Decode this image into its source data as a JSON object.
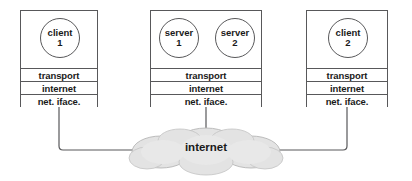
{
  "diagram": {
    "canvas": {
      "width": 412,
      "height": 181,
      "background": "#ffffff"
    },
    "colors": {
      "stroke": "#58585a",
      "text": "#1a1a1a",
      "cloud_fill": "#e3e3e3",
      "cloud_stroke": "#9a9a9a",
      "box_fill": "#ffffff"
    },
    "hosts": [
      {
        "id": "client-1-host",
        "x": 20,
        "y": 10,
        "width": 78,
        "height": 97,
        "apps": [
          {
            "id": "client-1",
            "line1": "client",
            "line2": "1",
            "cx": 59,
            "cy": 37,
            "r": 20
          }
        ],
        "layers": [
          {
            "id": "transport",
            "label": "transport"
          },
          {
            "id": "internet",
            "label": "internet"
          },
          {
            "id": "net-iface",
            "label": "net. iface."
          }
        ]
      },
      {
        "id": "server-host",
        "x": 150,
        "y": 10,
        "width": 112,
        "height": 97,
        "apps": [
          {
            "id": "server-1",
            "line1": "server",
            "line2": "1",
            "cx": 178,
            "cy": 37,
            "r": 20
          },
          {
            "id": "server-2",
            "line1": "server",
            "line2": "2",
            "cx": 234,
            "cy": 37,
            "r": 20
          }
        ],
        "layers": [
          {
            "id": "transport",
            "label": "transport"
          },
          {
            "id": "internet",
            "label": "internet"
          },
          {
            "id": "net-iface",
            "label": "net. iface."
          }
        ]
      },
      {
        "id": "client-2-host",
        "x": 306,
        "y": 10,
        "width": 82,
        "height": 97,
        "apps": [
          {
            "id": "client-2",
            "line1": "client",
            "line2": "2",
            "cx": 347,
            "cy": 37,
            "r": 20
          }
        ],
        "layers": [
          {
            "id": "transport",
            "label": "transport"
          },
          {
            "id": "internet",
            "label": "internet"
          },
          {
            "id": "net-iface",
            "label": "net. iface."
          }
        ]
      }
    ],
    "cloud": {
      "id": "internet-cloud",
      "label": "internet",
      "label_x": 180,
      "label_y": 148,
      "label_width": 52
    },
    "links": [
      {
        "id": "link-client-1",
        "from": "client-1-host",
        "to": "internet-cloud"
      },
      {
        "id": "link-server",
        "from": "server-host",
        "to": "internet-cloud"
      },
      {
        "id": "link-client-2",
        "from": "client-2-host",
        "to": "internet-cloud"
      }
    ],
    "app_stems": [
      {
        "id": "stem-client-1",
        "x": 59
      },
      {
        "id": "stem-server-1",
        "x": 178
      },
      {
        "id": "stem-server-2",
        "x": 234
      },
      {
        "id": "stem-client-2",
        "x": 347
      }
    ]
  }
}
